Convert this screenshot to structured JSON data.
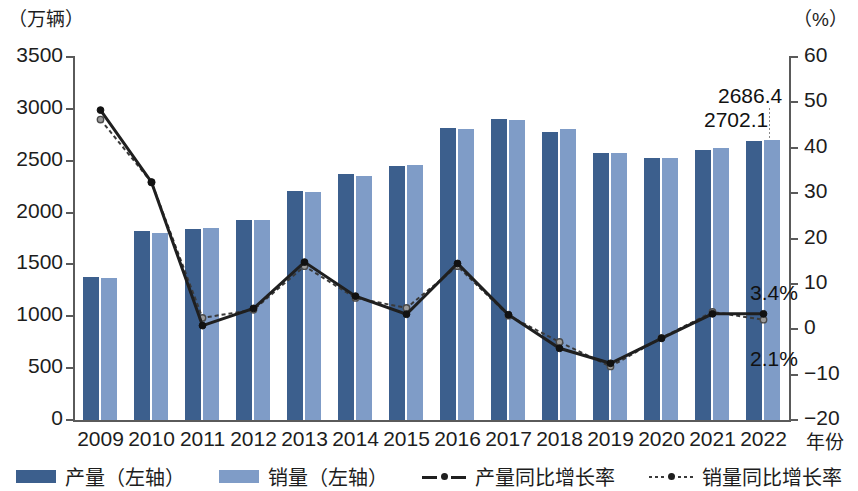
{
  "axes": {
    "left_unit": "（万辆）",
    "right_unit": "（%）",
    "x_title": "年份",
    "left_ticks": [
      "3500",
      "3000",
      "2500",
      "2000",
      "1500",
      "1000",
      "500",
      "0"
    ],
    "right_ticks": [
      "60",
      "50",
      "40",
      "30",
      "20",
      "10",
      "0",
      "−10",
      "−20"
    ]
  },
  "legend": {
    "items": [
      {
        "label": "产量（左轴）",
        "marker": "solid-swatch-dark",
        "color": "#3c5f8d"
      },
      {
        "label": "销量（左轴）",
        "marker": "solid-swatch-light",
        "color": "#7f9cc7"
      },
      {
        "label": "产量同比增长率",
        "marker": "solid-line-dot",
        "color": "#1f1f1f"
      },
      {
        "label": "销量同比增长率",
        "marker": "dashed-line-dot",
        "color": "#3a3a3a"
      }
    ]
  },
  "annotations": [
    {
      "id": "production-2022-value",
      "text": "2686.4"
    },
    {
      "id": "sales-2022-value",
      "text": "2702.1"
    },
    {
      "id": "production-growth-2022",
      "text": "3.4%"
    },
    {
      "id": "sales-growth-2022",
      "text": "2.1%"
    }
  ],
  "chart_data": {
    "type": "bar",
    "title": "",
    "xlabel": "年份",
    "ylabel": "万辆",
    "y2label": "%",
    "ylim": [
      0,
      3500
    ],
    "y2lim": [
      -20,
      60
    ],
    "grid": false,
    "legend_position": "bottom",
    "categories": [
      "2009",
      "2010",
      "2011",
      "2012",
      "2013",
      "2014",
      "2015",
      "2016",
      "2017",
      "2018",
      "2019",
      "2020",
      "2021",
      "2022"
    ],
    "series": [
      {
        "name": "产量（左轴）",
        "axis": "left",
        "type": "bar",
        "color": "#3c5f8d",
        "values": [
          1379.1,
          1826.5,
          1841.9,
          1927.2,
          2211.7,
          2372.3,
          2450.3,
          2811.9,
          2901.5,
          2780.9,
          2572.1,
          2522.5,
          2608.2,
          2686.4
        ]
      },
      {
        "name": "销量（左轴）",
        "axis": "left",
        "type": "bar",
        "color": "#7f9cc7",
        "values": [
          1364.5,
          1806.2,
          1850.5,
          1930.6,
          2198.4,
          2349.2,
          2459.8,
          2802.8,
          2887.9,
          2808.1,
          2576.9,
          2531.1,
          2627.5,
          2702.1
        ]
      },
      {
        "name": "产量同比增长率",
        "axis": "right",
        "type": "line",
        "style": "solid",
        "color": "#1f1f1f",
        "values": [
          48.3,
          32.4,
          0.8,
          4.6,
          14.8,
          7.3,
          3.3,
          14.5,
          3.2,
          -4.2,
          -7.5,
          -2.0,
          3.4,
          3.4
        ]
      },
      {
        "name": "销量同比增长率",
        "axis": "right",
        "type": "line",
        "style": "dashed",
        "color": "#3a3a3a",
        "values": [
          46.2,
          32.4,
          2.5,
          4.3,
          13.9,
          6.9,
          4.7,
          13.9,
          3.0,
          -2.8,
          -8.2,
          -1.9,
          3.8,
          2.1
        ]
      }
    ]
  }
}
